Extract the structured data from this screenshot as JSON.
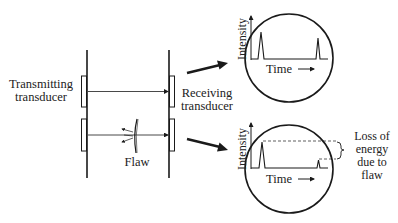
{
  "diagram": {
    "labels": {
      "transmitting": [
        "Transmitting",
        "transducer"
      ],
      "receiving": [
        "Receiving",
        "transducer"
      ],
      "flaw": "Flaw",
      "loss": [
        "Loss of",
        "energy",
        "due to",
        "flaw"
      ]
    },
    "scopes": [
      {
        "name": "no-flaw",
        "y_label": "Intensity",
        "x_label": "Time",
        "pulses": [
          "transmitted",
          "received-full"
        ]
      },
      {
        "name": "with-flaw",
        "y_label": "Intensity",
        "x_label": "Time",
        "pulses": [
          "transmitted",
          "received-reduced"
        ]
      }
    ],
    "colors": {
      "line": "#1a1a1a",
      "background": "#ffffff"
    }
  }
}
